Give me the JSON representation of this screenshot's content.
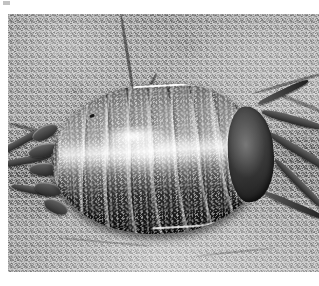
{
  "page": {
    "kind": "photograph",
    "color_mode": "grayscale",
    "width": 319,
    "height": 286,
    "background_color": "#ffffff"
  },
  "photo": {
    "x": 8,
    "y": 14,
    "width": 311,
    "height": 258,
    "description": "Black-and-white macro photograph of a woodlouse (pill bug) crawling on a rough, granular stone surface",
    "dominant_colors": {
      "substrate_light": "#b4b2ac",
      "substrate_mid": "#9a988f",
      "substrate_dark": "#6d6a64",
      "shell_highlight": "#f2f0ea",
      "shell_mid": "#6d6960",
      "shell_dark": "#26241f",
      "shadow": "#3a3732"
    }
  },
  "subject": {
    "common_name": "woodlouse",
    "orientation": "head to the right, tail to the left",
    "segment_count": 8,
    "features": [
      "segmented overlapping dorsal plates",
      "bright specular highlight band across the mid-back",
      "granular tubercled shell texture",
      "pale rim light along the upper-right carapace edge",
      "head shield at the right end",
      "uropods and rear plates fanning out at the left end",
      "jointed legs extending to the lower right",
      "two antennae reaching up-right and down-right",
      "soft contact shadow beneath the body"
    ]
  },
  "background": {
    "material": "porous weathered stone",
    "texture": "fine granular speckle with shallow pits",
    "features": [
      "dark diagonal crack descending from the top toward the animal's back",
      "dark crevices along the right edge",
      "dark recess at the left margin",
      "bright smooth lower area in front of the legs"
    ]
  }
}
